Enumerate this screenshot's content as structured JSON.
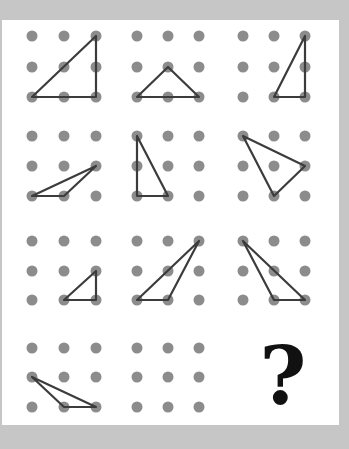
{
  "puzzle": {
    "type": "dot-grid-triangle-sequence",
    "grid_rows": 4,
    "grid_cols": 3,
    "dots_per_cell": "3x3",
    "colors": {
      "background": "#c6c6c6",
      "panel": "#ffffff",
      "dot": "#8c8c8c",
      "line": "#3c3c3c",
      "question_mark": "#111111"
    },
    "cells": [
      {
        "row": 0,
        "col": 0,
        "triangle": [
          [
            0,
            2
          ],
          [
            2,
            0
          ],
          [
            2,
            2
          ]
        ]
      },
      {
        "row": 0,
        "col": 1,
        "triangle": [
          [
            0,
            2
          ],
          [
            1,
            1
          ],
          [
            2,
            2
          ]
        ]
      },
      {
        "row": 0,
        "col": 2,
        "triangle": [
          [
            1,
            2
          ],
          [
            2,
            0
          ],
          [
            2,
            2
          ]
        ]
      },
      {
        "row": 1,
        "col": 0,
        "triangle": [
          [
            0,
            2
          ],
          [
            2,
            1
          ],
          [
            1,
            2
          ]
        ]
      },
      {
        "row": 1,
        "col": 1,
        "triangle": [
          [
            0,
            0
          ],
          [
            0,
            2
          ],
          [
            1,
            2
          ]
        ]
      },
      {
        "row": 1,
        "col": 2,
        "triangle": [
          [
            0,
            0
          ],
          [
            2,
            1
          ],
          [
            1,
            2
          ]
        ]
      },
      {
        "row": 2,
        "col": 0,
        "triangle": [
          [
            1,
            2
          ],
          [
            2,
            1
          ],
          [
            2,
            2
          ]
        ]
      },
      {
        "row": 2,
        "col": 1,
        "triangle": [
          [
            0,
            2
          ],
          [
            2,
            0
          ],
          [
            1,
            2
          ]
        ]
      },
      {
        "row": 2,
        "col": 2,
        "triangle": [
          [
            0,
            0
          ],
          [
            1,
            2
          ],
          [
            2,
            2
          ]
        ]
      },
      {
        "row": 3,
        "col": 0,
        "triangle": [
          [
            0,
            1
          ],
          [
            1,
            2
          ],
          [
            2,
            2
          ]
        ]
      },
      {
        "row": 3,
        "col": 1,
        "triangle": null
      },
      {
        "row": 3,
        "col": 2,
        "triangle": null,
        "label": "?"
      }
    ],
    "question_mark": "?"
  }
}
